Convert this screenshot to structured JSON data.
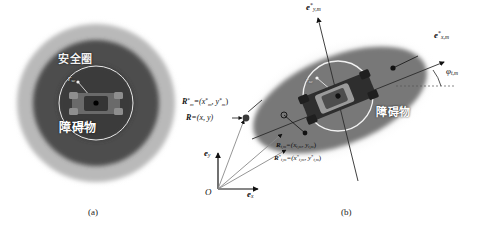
{
  "figure": {
    "caption_a": "(a)",
    "caption_b": "(b)"
  },
  "panel_a": {
    "name": "circular-safety-region",
    "safety_zone_label": "安全圈",
    "obstacle_label": "障碍物",
    "radius_label_base": "r",
    "radius_label_sub": "sc",
    "rings": [
      {
        "name": "outer-blur-ring",
        "color": "#c9c9c9",
        "radius_px": 87
      },
      {
        "name": "outer-gray-ring",
        "color": "#a8a8a8",
        "radius_px": 78
      },
      {
        "name": "mid-dark-ring",
        "color": "#4a4a4a",
        "radius_px": 62
      },
      {
        "name": "inner-safety-circle",
        "color": "#3a3a3a",
        "radius_px": 37
      }
    ],
    "vehicle": {
      "name": "vehicle-top-view",
      "color": "#5c5c5c",
      "heading_deg": 0
    }
  },
  "panel_b": {
    "name": "elliptical-safety-region",
    "obstacle_label": "障碍物",
    "radius_label_base": "r",
    "radius_label_sub": "sc",
    "angle_label_base": "φ",
    "angle_label_sub": "t,m",
    "axis_x_base": "e",
    "axis_x_sub": "x",
    "axis_y_base": "e",
    "axis_y_sub": "y",
    "origin_label": "O",
    "basis_x_star": {
      "base": "e",
      "sup": "*",
      "sub": "x,m"
    },
    "basis_y_star": {
      "base": "e",
      "sup": "*",
      "sub": "y,m"
    },
    "vec_R_star_m": "R",
    "vec_R_star_m_sup": "*",
    "vec_R_star_m_sub": "m",
    "vec_R_star_m_rhs": "=(x",
    "vec_R_star_m_rhs_sup": "*",
    "vec_R_star_m_rhs_sub": "m",
    "vec_R_star_m_rhs2": ", y",
    "vec_R_star_m_rhs2_sup": "*",
    "vec_R_star_m_rhs2_sub": "m",
    "vec_R_star_m_rhs3": ")",
    "vec_R": "R",
    "vec_R_rhs": "=(x, y)",
    "vec_R_tm": "R",
    "vec_R_tm_sub": "t,m",
    "vec_R_tm_rhs": "=(x",
    "vec_R_tm_rhs_sub": "t,m",
    "vec_R_tm_rhs2": ", y",
    "vec_R_tm_rhs2_sub": "t,m",
    "vec_R_tm_rhs3": ")",
    "vec_R_tm_star": "R",
    "vec_R_tm_star_sup": "*",
    "vec_R_tm_star_sub": "t,m",
    "vec_R_tm_star_rhs": "=(x",
    "vec_R_tm_star_rhs_sup": "*",
    "vec_R_tm_star_rhs_sub": "t,m",
    "vec_R_tm_star_rhs2": ", y",
    "vec_R_tm_star_rhs2_sup": "*",
    "vec_R_tm_star_rhs2_sub": "t,m",
    "vec_R_tm_star_rhs3": ")",
    "ellipse": {
      "name": "safety-ellipse",
      "color": "#6e6e6e",
      "rotation_deg": -22
    },
    "halo": {
      "name": "ellipse-halo",
      "color": "#d0d0d0"
    },
    "circle": {
      "name": "inner-safety-circle",
      "color": "#f0f0f0"
    },
    "vehicle": {
      "name": "vehicle-top-view",
      "color": "#3f3f3f",
      "heading_deg": -22
    }
  },
  "colors": {
    "background": "#ffffff",
    "ring_outer": "#c9c9c9",
    "ring_mid": "#a8a8a8",
    "ring_dark": "#4a4a4a",
    "ring_inner": "#3a3a3a",
    "stroke": "#111111",
    "label_light": "#f2f2f2"
  }
}
